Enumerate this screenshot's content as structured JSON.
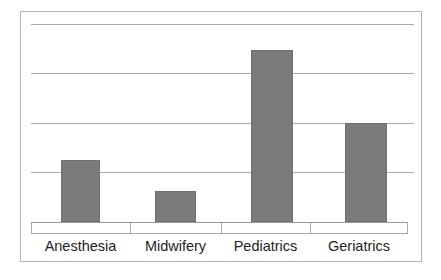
{
  "chart_data": {
    "type": "bar",
    "title": "",
    "subtitle": "",
    "xlabel": "",
    "ylabel": "",
    "categories": [
      "Anesthesia",
      "Midwifery",
      "Pediatrics",
      "Geriatrics"
    ],
    "values": [
      1.26,
      0.63,
      3.49,
      2.01
    ],
    "series": [
      {
        "name": "",
        "values": [
          1.26,
          0.63,
          3.49,
          2.01
        ]
      }
    ],
    "ylim": [
      0,
      4
    ],
    "yticks": [
      0,
      1,
      2,
      3,
      4
    ],
    "ytick_labels": [
      "",
      "",
      "",
      "",
      ""
    ],
    "grid": true,
    "gridlines_count": 4,
    "legend": false,
    "legend_position": "none",
    "annotations": [],
    "colors": {
      "bar_fill": "#7b7b7b",
      "bar_stroke": "#6f6f6f",
      "gridline": "#a9a9a9",
      "axis": "#9a9a9a",
      "frame": "#b4b4b4",
      "background": "#ffffff",
      "label_text": "#231f20"
    }
  },
  "figure": {
    "frame_label": "chart-frame",
    "plot_label": "plot-area"
  }
}
